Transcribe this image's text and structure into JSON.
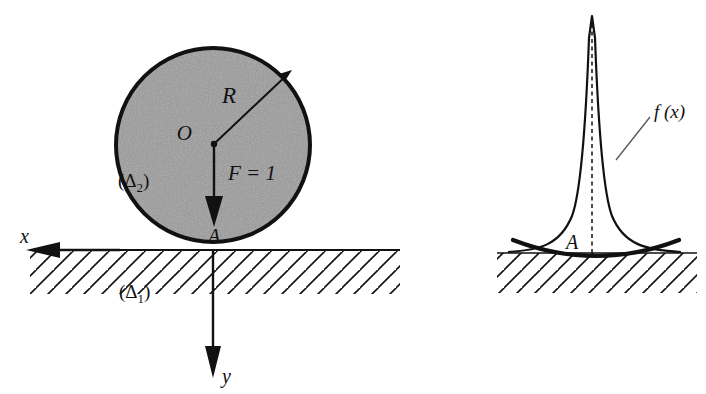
{
  "figure": {
    "domain": "diagram",
    "background_color": "#ffffff",
    "ink_color": "#111111",
    "body_fill_color": "#9a9a9a"
  },
  "left_panel": {
    "name": "contact-geometry",
    "circle": {
      "label_center": "O",
      "center_x": 213,
      "center_y": 145,
      "radius_px": 97,
      "fill": "#9a9a9a",
      "stroke_width": 4
    },
    "labels": {
      "radius": "R",
      "center": "O",
      "force": "F = 1",
      "contact_point": "A",
      "body": "(Δ2)",
      "body_main": "(Δ",
      "body_sub": "2",
      "ground": "(Δ1)",
      "ground_main": "(Δ",
      "ground_sub": "1",
      "axis_x": "x",
      "axis_y": "y"
    },
    "ground_line": {
      "y": 250,
      "x_start": 30,
      "x_end": 400,
      "hatch_angle_deg": 45,
      "hatch_spacing_px": 18
    },
    "axes": {
      "x_arrow_direction": "left",
      "x_tip_x": 30,
      "y_arrow_direction": "down",
      "y_tip_y": 375
    }
  },
  "right_panel": {
    "name": "pressure-distribution",
    "labels": {
      "function": "f (x)",
      "contact_point": "A"
    },
    "curve": {
      "peak_x": 592,
      "peak_y": 18,
      "baseline_y": 253,
      "left_tail_x": 510,
      "right_tail_x": 678,
      "centerline_style": "dashed"
    },
    "ground_line": {
      "y": 253,
      "x_start": 497,
      "x_end": 697,
      "hatch_angle_deg": 45,
      "hatch_spacing_px": 18,
      "deformed_arc": true
    },
    "leader_line": {
      "from_x": 618,
      "from_y": 158,
      "to_x": 648,
      "to_y": 117
    }
  }
}
